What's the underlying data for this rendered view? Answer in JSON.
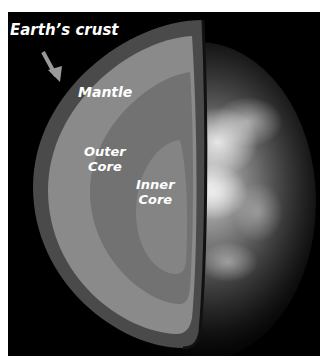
{
  "diagram": {
    "labels": {
      "crust": "Earth’s crust",
      "mantle": "Mantle",
      "outer_core_line1": "Outer",
      "outer_core_line2": "Core",
      "inner_core_line1": "Inner",
      "inner_core_line2": "Core"
    },
    "colors": {
      "background": "#000000",
      "crust": "#4a4a4a",
      "mantle": "#8a8a8a",
      "outer_core": "#727272",
      "inner_core": "#848484",
      "label_text": "#ffffff",
      "arrow": "#9a9a9a"
    }
  }
}
